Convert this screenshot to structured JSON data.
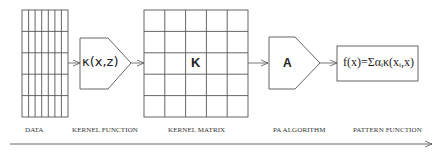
{
  "diagram": {
    "nodes": [
      {
        "id": "data",
        "label": "DATA",
        "shape": "grid",
        "columns": 7,
        "rows": 5
      },
      {
        "id": "kernel_function",
        "label": "KERNEL FUNCTION",
        "shape": "pentagon-arrow",
        "symbol": "κ(x,z)"
      },
      {
        "id": "kernel_matrix",
        "label": "KERNEL MATRIX",
        "shape": "grid",
        "columns": 5,
        "rows": 5,
        "symbol": "K"
      },
      {
        "id": "pa_algorithm",
        "label": "PA ALGORITHM",
        "shape": "pentagon-arrow",
        "symbol": "A"
      },
      {
        "id": "pattern_function",
        "label": "PATTERN FUNCTION",
        "shape": "box",
        "symbol": "f(x)=Σαᵢκ(xᵢ,x)"
      }
    ],
    "edges": [
      {
        "from": "data",
        "to": "kernel_function"
      },
      {
        "from": "kernel_function",
        "to": "kernel_matrix"
      },
      {
        "from": "kernel_matrix",
        "to": "pa_algorithm"
      },
      {
        "from": "pa_algorithm",
        "to": "pattern_function"
      }
    ],
    "flow_arrow": "left-to-right"
  },
  "labels": {
    "data": "DATA",
    "kernel_function": "KERNEL FUNCTION",
    "kernel_matrix": "KERNEL MATRIX",
    "pa_algorithm": "PA ALGORITHM",
    "pattern_function": "PATTERN FUNCTION"
  },
  "symbols": {
    "kernel": "κ(x,z)",
    "matrix": "K",
    "algorithm": "A",
    "pattern": "f(x)=Σαᵢκ(xᵢ,x)"
  },
  "colors": {
    "line": "#555555",
    "text": "#222222",
    "background": "#ffffff"
  }
}
